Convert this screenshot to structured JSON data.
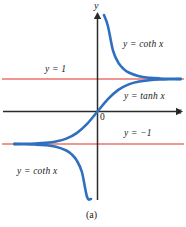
{
  "figure": {
    "caption": "(a)",
    "axes": {
      "y_axis_label": "y",
      "x_axis_label": "x",
      "origin_label": "0"
    },
    "labels": {
      "coth_top": "y = coth x",
      "tanh": "y = tanh x",
      "level_pos_one": "y = 1",
      "level_neg_one": "y = −1",
      "coth_bottom": "y = coth x"
    },
    "colors": {
      "curve": "#2f6fc0",
      "asymptote": "#e8736a",
      "axis": "#2b2b2b",
      "text": "#1a1a1a",
      "background": "#ffffff"
    }
  },
  "chart_data": {
    "type": "line",
    "title": "",
    "subtitle": "",
    "xlabel": "x",
    "ylabel": "y",
    "xlim": [
      -3.2,
      3.2
    ],
    "ylim": [
      -4.2,
      4.2
    ],
    "grid": false,
    "legend": "inline-annotations",
    "annotations": [
      {
        "text": "y = coth x",
        "x": 1.0,
        "y": 2.3
      },
      {
        "text": "y = tanh x",
        "x": 1.1,
        "y": 0.45
      },
      {
        "text": "y = 1",
        "x": -1.6,
        "y": 1.45
      },
      {
        "text": "y = −1",
        "x": 1.1,
        "y": -1.05
      },
      {
        "text": "y = coth x",
        "x": -2.5,
        "y": -2.5
      },
      {
        "text": "0",
        "x": 0.12,
        "y": -0.28
      },
      {
        "text": "(a)",
        "x": 0.0,
        "y": -4.1
      }
    ],
    "asymptotes": [
      {
        "name": "y = 1",
        "type": "horizontal",
        "value": 1
      },
      {
        "name": "y = -1",
        "type": "horizontal",
        "value": -1
      }
    ],
    "series": [
      {
        "name": "y = tanh x",
        "color": "#2f6fc0",
        "x": [
          -3.2,
          -2.8,
          -2.4,
          -2.0,
          -1.6,
          -1.2,
          -0.8,
          -0.4,
          0.0,
          0.4,
          0.8,
          1.2,
          1.6,
          2.0,
          2.4,
          2.8,
          3.2
        ],
        "y": [
          -0.9967,
          -0.9926,
          -0.9837,
          -0.964,
          -0.9217,
          -0.8337,
          -0.664,
          -0.3799,
          0.0,
          0.3799,
          0.664,
          0.8337,
          0.9217,
          0.964,
          0.9837,
          0.9926,
          0.9967
        ]
      },
      {
        "name": "y = coth x (x > 0)",
        "color": "#2f6fc0",
        "x": [
          0.25,
          0.4,
          0.6,
          0.8,
          1.0,
          1.2,
          1.6,
          2.0,
          2.4,
          2.8,
          3.2
        ],
        "y": [
          4.0533,
          2.6319,
          1.862,
          1.5059,
          1.313,
          1.1995,
          1.085,
          1.0373,
          1.0166,
          1.0074,
          1.0033
        ]
      },
      {
        "name": "y = coth x (x < 0)",
        "color": "#2f6fc0",
        "x": [
          -3.2,
          -2.8,
          -2.4,
          -2.0,
          -1.6,
          -1.2,
          -1.0,
          -0.8,
          -0.6,
          -0.4,
          -0.25
        ],
        "y": [
          -1.0033,
          -1.0074,
          -1.0166,
          -1.0373,
          -1.085,
          -1.1995,
          -1.313,
          -1.5059,
          -1.862,
          -2.6319,
          -4.0533
        ]
      }
    ]
  }
}
